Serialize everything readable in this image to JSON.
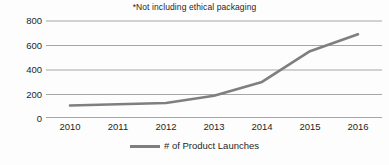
{
  "chart_data": {
    "type": "line",
    "title": "*Not including ethical packaging",
    "xlabel": "",
    "ylabel": "",
    "categories": [
      "2010",
      "2011",
      "2012",
      "2013",
      "2014",
      "2015",
      "2016"
    ],
    "x": [
      2010,
      2011,
      2012,
      2013,
      2014,
      2015,
      2016
    ],
    "series": [
      {
        "name": "# of Product Launches",
        "values": [
          100,
          110,
          120,
          180,
          295,
          550,
          690
        ],
        "color": "#7f7f7f"
      }
    ],
    "yticks": [
      0,
      200,
      400,
      600,
      800
    ],
    "ytick_labels": [
      "0",
      "200",
      "400",
      "600",
      "800"
    ],
    "ylim": [
      0,
      800
    ],
    "xlim": [
      2010,
      2016
    ],
    "grid": "horizontal",
    "legend": {
      "position": "bottom-center",
      "entries": [
        "# of Product Launches"
      ]
    },
    "colors": {
      "line": "#7f7f7f",
      "gridline": "#a6a6a6",
      "text": "#1f1f1f",
      "background": "#fdfdfd"
    }
  }
}
